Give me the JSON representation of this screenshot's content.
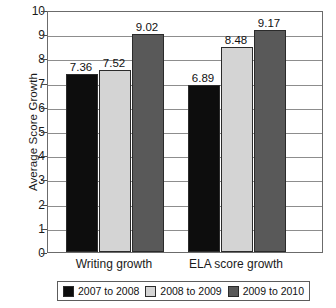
{
  "chart_data": {
    "type": "bar",
    "title": "",
    "xlabel": "",
    "ylabel": "Average Score Growth",
    "ylim": [
      0,
      10
    ],
    "ytick_labels": [
      "10",
      "9",
      "8",
      "7",
      "6",
      "5",
      "4",
      "3",
      "2",
      "1",
      "0"
    ],
    "yticks": [
      10,
      9,
      8,
      7,
      6,
      5,
      4,
      3,
      2,
      1,
      0
    ],
    "grid": true,
    "legend_position": "bottom",
    "categories": [
      "Writing growth",
      "ELA score growth"
    ],
    "series": [
      {
        "name": "2007 to 2008",
        "color": "#0d0d0d",
        "values": [
          7.36,
          7.52
        ],
        "labels": [
          "7.36",
          "6.89"
        ]
      },
      {
        "name": "2008 to 2009",
        "color": "#d4d4d4",
        "values": [
          7.52,
          8.48
        ],
        "labels": [
          "7.52",
          "8.48"
        ]
      },
      {
        "name": "2009 to 2010",
        "color": "#595959",
        "values": [
          9.02,
          9.17
        ],
        "labels": [
          "9.02",
          "9.17"
        ]
      }
    ],
    "bars": [
      {
        "group": "Writing growth",
        "series": "2007 to 2008",
        "value": 7.36,
        "label": "7.36",
        "color": "#0d0d0d"
      },
      {
        "group": "Writing growth",
        "series": "2008 to 2009",
        "value": 7.52,
        "label": "7.52",
        "color": "#d4d4d4"
      },
      {
        "group": "Writing growth",
        "series": "2009 to 2010",
        "value": 9.02,
        "label": "9.02",
        "color": "#595959"
      },
      {
        "group": "ELA score growth",
        "series": "2007 to 2008",
        "value": 6.89,
        "label": "6.89",
        "color": "#0d0d0d"
      },
      {
        "group": "ELA score growth",
        "series": "2008 to 2009",
        "value": 8.48,
        "label": "8.48",
        "color": "#d4d4d4"
      },
      {
        "group": "ELA score growth",
        "series": "2009 to 2010",
        "value": 9.17,
        "label": "9.17",
        "color": "#595959"
      }
    ]
  },
  "axis": {
    "y_title": "Average Score Growth"
  },
  "legend": {
    "items": [
      {
        "label": "2007 to 2008",
        "color": "#0d0d0d"
      },
      {
        "label": "2008 to 2009",
        "color": "#d4d4d4"
      },
      {
        "label": "2009 to 2010",
        "color": "#595959"
      }
    ]
  },
  "colors": {
    "series_1": "#0d0d0d",
    "series_2": "#d4d4d4",
    "series_3": "#595959",
    "axis": "#6b6b6b",
    "grid": "#8d8d8d",
    "text": "#1a1a1a",
    "background": "#ffffff"
  }
}
